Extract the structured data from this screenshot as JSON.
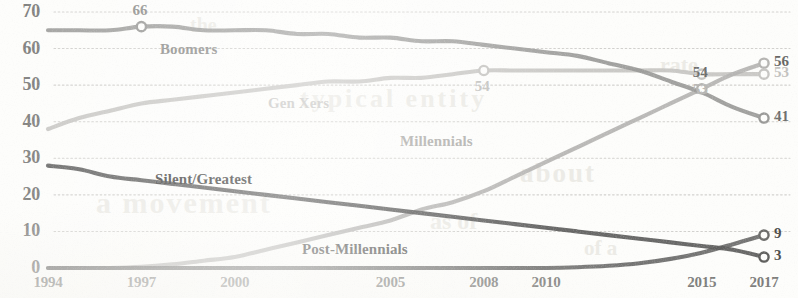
{
  "chart_data": {
    "type": "line",
    "title": "",
    "subtitle": "",
    "xlabel": "",
    "ylabel": "",
    "xlim": [
      1994,
      2017
    ],
    "ylim": [
      0,
      70
    ],
    "grid": true,
    "grid_style": "dotted-horizontal",
    "legend": "inline-series-labels",
    "x_tick_labels": [
      "1994",
      "1997",
      "2000",
      "2005",
      "2008",
      "2010",
      "2015",
      "2017"
    ],
    "x_tick_values": [
      1994,
      1997,
      2000,
      2005,
      2008,
      2010,
      2015,
      2017
    ],
    "y_tick_labels": [
      "0",
      "10",
      "20",
      "30",
      "40",
      "50",
      "60",
      "70"
    ],
    "y_tick_values": [
      0,
      10,
      20,
      30,
      40,
      50,
      60,
      70
    ],
    "x": [
      1994,
      1995,
      1996,
      1997,
      1998,
      1999,
      2000,
      2001,
      2002,
      2003,
      2004,
      2005,
      2006,
      2007,
      2008,
      2009,
      2010,
      2011,
      2012,
      2013,
      2014,
      2015,
      2016,
      2017
    ],
    "series": [
      {
        "name": "Boomers",
        "color": "#9a9a98",
        "values": [
          65,
          65,
          65,
          66,
          66,
          65,
          65,
          65,
          64,
          64,
          63,
          63,
          62,
          62,
          61,
          60,
          59,
          58,
          56,
          54,
          51,
          48,
          44,
          41
        ],
        "label_x": 160,
        "label_y": 41,
        "end_value": 41
      },
      {
        "name": "Gen Xers",
        "color": "#c6c5c2",
        "values": [
          38,
          41,
          43,
          45,
          46,
          47,
          48,
          49,
          50,
          51,
          51,
          52,
          52,
          53,
          54,
          54,
          54,
          54,
          54,
          54,
          54,
          53,
          53,
          53
        ],
        "label_x": 268,
        "label_y": 95,
        "end_value": 53
      },
      {
        "name": "Millennials",
        "color": "#b5b4b1",
        "values": [
          0,
          0,
          0,
          0.3,
          1,
          2,
          3,
          5,
          7,
          9,
          11,
          13,
          16,
          18,
          21,
          25,
          29,
          33,
          37,
          41,
          45,
          49,
          53,
          56
        ],
        "label_x": 400,
        "label_y": 133,
        "end_value": 56
      },
      {
        "name": "Silent/Greatest",
        "color": "#5e5e5c",
        "values": [
          28,
          27,
          25,
          24,
          23,
          22,
          21,
          20,
          19,
          18,
          17,
          16,
          15,
          14,
          13,
          12,
          11,
          10,
          9,
          8,
          7,
          6,
          5,
          3
        ],
        "label_x": 155,
        "label_y": 171,
        "end_value": 3
      },
      {
        "name": "Post-Millennials",
        "color": "#6b6b69",
        "values": [
          0,
          0,
          0,
          0,
          0,
          0,
          0,
          0,
          0,
          0,
          0,
          0,
          0,
          0,
          0,
          0,
          0,
          0.2,
          0.6,
          1.3,
          2.5,
          4.2,
          6.5,
          9
        ],
        "label_x": 302,
        "label_y": 241,
        "end_value": 9
      }
    ],
    "point_labels": [
      {
        "text": "66",
        "series": "Boomers",
        "x": 1997,
        "y": 66,
        "pos": "above",
        "color": "#8e8e8c"
      },
      {
        "text": "54",
        "series": "Gen Xers",
        "x": 2008,
        "y": 54,
        "pos": "below",
        "color": "#c2c1be"
      },
      {
        "text": "54",
        "series": "Millennials",
        "x": 2015,
        "y": 49,
        "pos": "above",
        "color": "#6f6f6d"
      },
      {
        "text": "53",
        "series": "Gen Xers",
        "x": 2015,
        "y": 53,
        "pos": "below",
        "color": "#b9b8b5"
      }
    ],
    "end_labels": [
      {
        "text": "56",
        "series": "Millennials",
        "value": 56,
        "color": "#666664"
      },
      {
        "text": "53",
        "series": "Gen Xers",
        "value": 53,
        "color": "#c2c1be"
      },
      {
        "text": "41",
        "series": "Boomers",
        "value": 41,
        "color": "#6f6f6d"
      },
      {
        "text": "9",
        "series": "Post-Millennials",
        "value": 9,
        "color": "#4e4e4c"
      },
      {
        "text": "3",
        "series": "Silent/Greatest",
        "value": 3,
        "color": "#4e4e4c"
      }
    ],
    "series_label_colors": {
      "Boomers": "#8d8d8b",
      "Gen Xers": "#c9c8c5",
      "Millennials": "#b0afac",
      "Silent/Greatest": "#4a4a48",
      "Post-Millennials": "#5a5a58"
    }
  },
  "axis": {
    "y_ticks": [
      "70",
      "60",
      "50",
      "40",
      "30",
      "20",
      "10",
      "0"
    ],
    "x_ticks": [
      "1994",
      "1997",
      "2000",
      "2005",
      "2008",
      "2010",
      "2015",
      "2017"
    ]
  },
  "series_labels": {
    "boomers": "Boomers",
    "gen_xers": "Gen Xers",
    "millennials": "Millennials",
    "silent_greatest": "Silent/Greatest",
    "post_millennials": "Post-Millennials"
  },
  "point_label_text": {
    "boomers_1997": "66",
    "genx_2008": "54",
    "millennials_2015": "54",
    "genx_2015": "53"
  },
  "end_label_text": {
    "millennials": "56",
    "gen_xers": "53",
    "boomers": "41",
    "post_millennials": "9",
    "silent_greatest": "3"
  },
  "ghost_text": {
    "g1": "rate",
    "g2": "of a",
    "g3": "about",
    "g4": "typical entity",
    "g5": "a movement",
    "g6": "as of",
    "g7": "the"
  }
}
